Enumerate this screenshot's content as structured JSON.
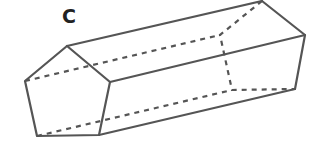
{
  "figure": {
    "label": "C",
    "shape": "pentagonal prism",
    "stroke_color": "#555555",
    "front_face": [
      [
        67,
        46
      ],
      [
        110,
        82
      ],
      [
        99,
        135
      ],
      [
        37,
        136
      ],
      [
        25,
        81
      ]
    ],
    "back_face": [
      [
        262,
        0
      ],
      [
        305,
        35
      ],
      [
        295,
        89
      ],
      [
        232,
        90
      ],
      [
        220,
        35
      ]
    ]
  }
}
